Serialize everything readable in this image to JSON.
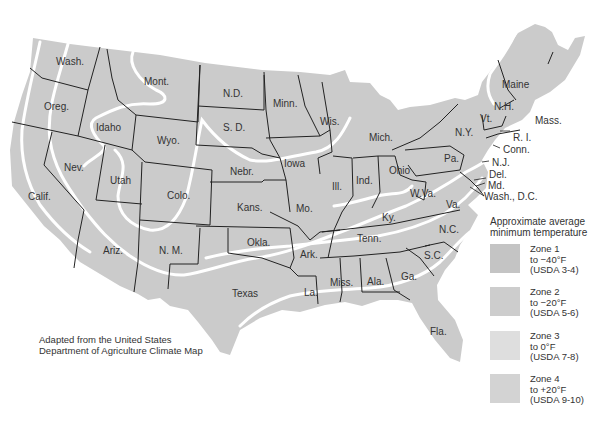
{
  "map": {
    "title": "Approximate average minimum temperature zones of the United States",
    "credit": {
      "line1": "Adapted from the United States",
      "line2": "Department of Agriculture Climate Map"
    },
    "colors": {
      "land": "#cbcbcb",
      "zone_line": "#ffffff",
      "state_border": "#222222",
      "background": "#ffffff"
    },
    "states": [
      {
        "label": "Wash.",
        "x": 56,
        "y": 57
      },
      {
        "label": "Oreg.",
        "x": 44,
        "y": 102
      },
      {
        "label": "Idaho",
        "x": 96,
        "y": 123
      },
      {
        "label": "Mont.",
        "x": 144,
        "y": 77
      },
      {
        "label": "Wyo.",
        "x": 157,
        "y": 136
      },
      {
        "label": "N.D.",
        "x": 223,
        "y": 89
      },
      {
        "label": "S. D.",
        "x": 223,
        "y": 123
      },
      {
        "label": "Minn.",
        "x": 273,
        "y": 99
      },
      {
        "label": "Wis.",
        "x": 320,
        "y": 117
      },
      {
        "label": "Mich.",
        "x": 369,
        "y": 133
      },
      {
        "label": "N.Y.",
        "x": 455,
        "y": 128
      },
      {
        "label": "Vt.",
        "x": 480,
        "y": 114
      },
      {
        "label": "N.H.",
        "x": 494,
        "y": 102
      },
      {
        "label": "Maine",
        "x": 502,
        "y": 80
      },
      {
        "label": "Mass.",
        "x": 535,
        "y": 116
      },
      {
        "label": "R. I.",
        "x": 513,
        "y": 133
      },
      {
        "label": "Conn.",
        "x": 503,
        "y": 145
      },
      {
        "label": "N.J.",
        "x": 492,
        "y": 158
      },
      {
        "label": "Del.",
        "x": 489,
        "y": 170
      },
      {
        "label": "Md.",
        "x": 488,
        "y": 181
      },
      {
        "label": "Wash., D.C.",
        "x": 484,
        "y": 192
      },
      {
        "label": "Pa.",
        "x": 444,
        "y": 154
      },
      {
        "label": "Ohio",
        "x": 389,
        "y": 166
      },
      {
        "label": "Ind.",
        "x": 356,
        "y": 176
      },
      {
        "label": "Ill.",
        "x": 332,
        "y": 182
      },
      {
        "label": "Iowa",
        "x": 284,
        "y": 159
      },
      {
        "label": "Nebr.",
        "x": 230,
        "y": 167
      },
      {
        "label": "Nev.",
        "x": 64,
        "y": 163
      },
      {
        "label": "Utah",
        "x": 110,
        "y": 176
      },
      {
        "label": "Colo.",
        "x": 167,
        "y": 191
      },
      {
        "label": "Calif.",
        "x": 28,
        "y": 192
      },
      {
        "label": "Kans.",
        "x": 237,
        "y": 203
      },
      {
        "label": "Mo.",
        "x": 296,
        "y": 204
      },
      {
        "label": "Ky.",
        "x": 382,
        "y": 213
      },
      {
        "label": "W.Va.",
        "x": 410,
        "y": 189
      },
      {
        "label": "Va.",
        "x": 446,
        "y": 200
      },
      {
        "label": "Tenn.",
        "x": 357,
        "y": 234
      },
      {
        "label": "N.C.",
        "x": 439,
        "y": 225
      },
      {
        "label": "S.C.",
        "x": 424,
        "y": 251
      },
      {
        "label": "Ark.",
        "x": 300,
        "y": 250
      },
      {
        "label": "Okla.",
        "x": 247,
        "y": 238
      },
      {
        "label": "Ariz.",
        "x": 103,
        "y": 246
      },
      {
        "label": "N. M.",
        "x": 159,
        "y": 246
      },
      {
        "label": "Texas",
        "x": 232,
        "y": 289
      },
      {
        "label": "La.",
        "x": 304,
        "y": 288
      },
      {
        "label": "Miss.",
        "x": 330,
        "y": 278
      },
      {
        "label": "Ala.",
        "x": 367,
        "y": 277
      },
      {
        "label": "Ga.",
        "x": 401,
        "y": 272
      },
      {
        "label": "Fla.",
        "x": 430,
        "y": 327
      }
    ]
  },
  "legend": {
    "title_line1": "Approximate average",
    "title_line2": "minimum temperature",
    "items": [
      {
        "name": "Zone 1",
        "temp": "to −40°F",
        "usda": "(USDA 3-4)",
        "color": "#c4c4c4",
        "y": 244
      },
      {
        "name": "Zone 2",
        "temp": "to −20°F",
        "usda": "(USDA 5-6)",
        "color": "#cdcdcd",
        "y": 287
      },
      {
        "name": "Zone 3",
        "temp": "to 0°F",
        "usda": "(USDA 7-8)",
        "color": "#dedede",
        "y": 331
      },
      {
        "name": "Zone 4",
        "temp": "to +20°F",
        "usda": "(USDA 9-10)",
        "color": "#d3d3d3",
        "y": 374
      }
    ]
  }
}
